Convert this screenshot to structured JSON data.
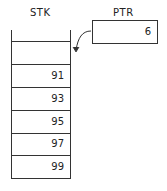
{
  "diagram": {
    "stack_label": "STK",
    "pointer_label": "PTR",
    "pointer_value": "6",
    "cells": [
      "",
      "91",
      "93",
      "95",
      "97",
      "99"
    ],
    "line_color": "#333333"
  }
}
